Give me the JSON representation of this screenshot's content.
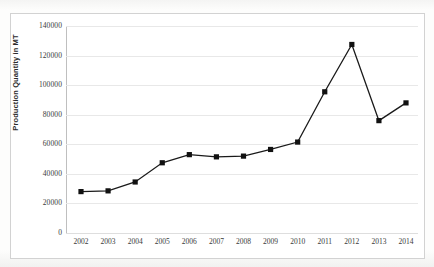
{
  "chart_data": {
    "type": "line",
    "title": "",
    "xlabel": "",
    "ylabel": "Production Quantity in MT",
    "categories": [
      "2002",
      "2003",
      "2004",
      "2005",
      "2006",
      "2007",
      "2008",
      "2009",
      "2010",
      "2011",
      "2012",
      "2013",
      "2014"
    ],
    "values": [
      28000,
      28500,
      34500,
      47500,
      53000,
      51500,
      52000,
      56500,
      61500,
      95500,
      127500,
      76000,
      88000
    ],
    "series": [
      {
        "name": "Production Quantity",
        "values": [
          28000,
          28500,
          34500,
          47500,
          53000,
          51500,
          52000,
          56500,
          61500,
          95500,
          127500,
          76000,
          88000
        ]
      }
    ],
    "ylim": [
      0,
      140000
    ],
    "y_ticks": [
      0,
      20000,
      40000,
      60000,
      80000,
      100000,
      120000,
      140000
    ],
    "y_tick_labels": [
      "0",
      "20000",
      "40000",
      "60000",
      "80000",
      "100000",
      "120000",
      "140000"
    ],
    "grid": true,
    "grid_axis": "y",
    "legend": false,
    "legend_position": "none",
    "marker": "square",
    "marker_color": "#111111",
    "line_color": "#1a1a1a"
  },
  "colors": {
    "line": "#1a1a1a",
    "marker": "#111111",
    "grid": "#e8e8e8",
    "axis": "#bfbfbf",
    "frame": "#d2d2d2",
    "text": "#3a3a3a",
    "plot_background": "#ffffff",
    "page_background": "#fbfbfa"
  }
}
